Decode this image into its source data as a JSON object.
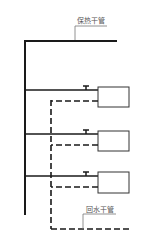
{
  "diagram": {
    "type": "heating-system-schematic",
    "labels": {
      "supply_main": "保热干管",
      "return_main": "回水干管"
    },
    "colors": {
      "line": "#1a1a1a",
      "leader": "#777777",
      "label": "#555555",
      "background": "#ffffff"
    },
    "radiators": [
      {
        "id": 1,
        "branch_y": 90,
        "return_y": 101
      },
      {
        "id": 2,
        "branch_y": 134,
        "return_y": 145
      },
      {
        "id": 3,
        "branch_y": 176,
        "return_y": 187
      }
    ]
  }
}
